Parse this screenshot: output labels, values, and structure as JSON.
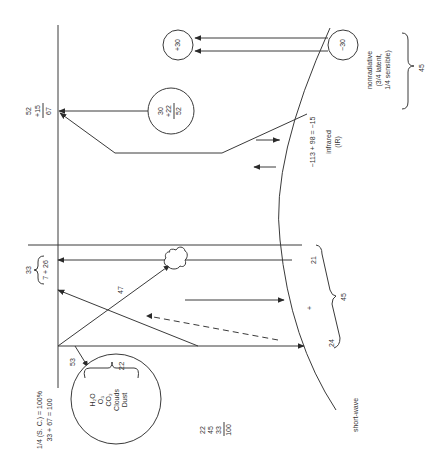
{
  "diagram": {
    "title_formula_line1": "1/4 (S. C.) = 100%",
    "title_formula_line2": "33 + 67 = 100",
    "short_wave_label": "short-wave",
    "absorbed_label": "53",
    "atmosphere_circle": {
      "total": "22",
      "constituents": [
        "H₂O",
        "O₃",
        "CO₂",
        "Clouds",
        "Dust"
      ]
    },
    "sum_column": [
      "22",
      "45",
      "33",
      "100"
    ],
    "reflected_top": {
      "total": "33",
      "split": "7 + 26"
    },
    "cloud_path_label": "47",
    "surface_values": {
      "direct": "24",
      "diffuse_plus": "+",
      "diffuse": "21",
      "total": "45"
    },
    "outgoing_top": {
      "line1": "52",
      "line2": "+15",
      "line3": "67"
    },
    "atmosphere_emission_circle": {
      "line1": "30",
      "line2": "+22",
      "line3": "52"
    },
    "infrared": {
      "equation": "−113  +  98  =  −15",
      "label_line1": "infrared",
      "label_line2": "(IR)"
    },
    "nonradiative": {
      "plus_circle": "+30",
      "minus_circle": "−30",
      "label_line1": "nonradiative",
      "label_line2": "(3/4 latent,",
      "label_line3": "1/4 sensible)",
      "total": "45"
    }
  }
}
